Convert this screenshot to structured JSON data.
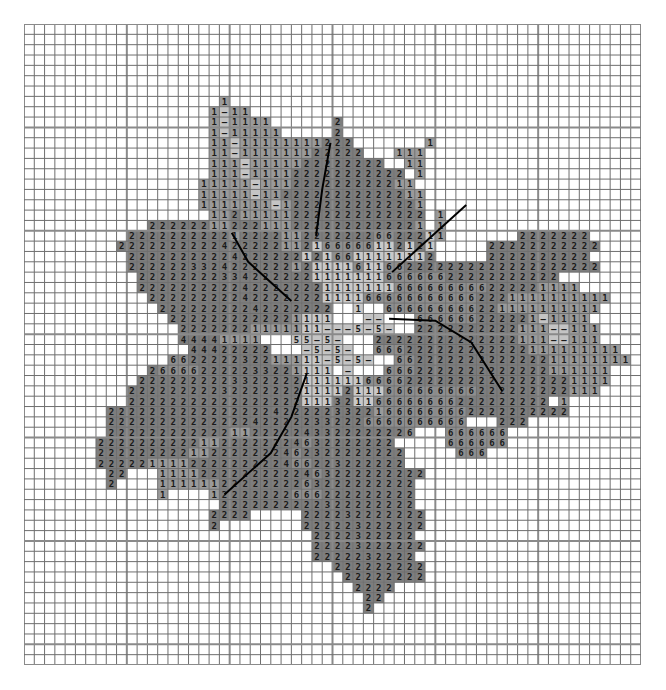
{
  "grid": {
    "cols": 60,
    "rows": 62,
    "major_every": 10
  },
  "colors": {
    "empty": "#ffffff",
    "line": "#6e6e6e",
    "major_line": "#8a8a8a",
    "2": "#7d7d7d",
    "1": "#9a9a9a",
    "1c": "#c9c9c9",
    "-": "#c4c4c4",
    "3": "#7d7d7d",
    "4": "#7d7d7d",
    "5": "#c4c4c4",
    "6": "#8e8e8e",
    "w": "#ffffff"
  },
  "legend_symbols": [
    "1",
    "2",
    "3",
    "4",
    "5",
    "6",
    "-"
  ],
  "rows": [
    "............................................................",
    "............................................................",
    "............................................................",
    "............................................................",
    "............................................................",
    "............................................................",
    "............................................................",
    "...................1........................................",
    "..................1-11......................................",
    "..................1-1111......2.............................",
    "..................1-11111.....2.............................",
    "..................11-11111111222.......1....................",
    "..................11-111111122222...111.....................",
    "..................111-1111122222222..11.....................",
    "..................111-111122222222222.1.....................",
    ".................11111-111222222222211......................",
    ".................11111-1122222222222211.....................",
    ".................1111111-12222222222221.....................",
    "..................112111112222222222222.1...................",
    "............222222112221112222222222221.1...................",
    "..........2222222222122221122222226622211.......2222222.....",
    ".........2222222222422222112166666112121.....22222222222....",
    "..........222222222242222221216611111112.....2222222222.....",
    "..........2222223324222222121111611662222222222222222222....",
    "...........22222222334222222111111166666622222222222........",
    "...........2222222222422222221111111666666666222221111......",
    "............222222222422222221111666666666662221111111111...",
    ".............22222222242222222..1..666666666221111111111....",
    "..............2222222222221111w..--..w666666222221-1111.....",
    "...............22222221111111---5-5-w.2222222222111--111....",
    "...............44441111ww.55-5-.w.22222222222222111--111....",
    "................44422222ww.-5-5-.w666222222222222111111111..",
    "..............662222232211111-5-5-.w66222222222222211111111.",
    "............266662222233221111.-..w6662222222222222111111...",
    "...........2222222223322222111111666622222222222222221111...",
    "..........2222222223222222211112111666666666222222222111....",
    "..........22222222222222222111321166666666222222222.1.......",
    "........222222222222222242222233221666666662222222222.......",
    "........22222222222222422222332226666666666...222...........",
    "........222222222222112222243322222226...666666.............",
    ".......22222222221122222224632222222.....666666.............",
    ".......222222222112222222462322222222.....666...............",
    ".......222221111222222222466223222222.......................",
    "........22...11112222222222463222222222.....................",
    "........2....1111112222222263222222222......................",
    ".............1....12222222666222222222......................",
    "...................2222222222322222222......................",
    "..................2222.....222232222222.....................",
    "..................2........222223222222.....................",
    "............................2222322222......................",
    "............................22223222222.....................",
    "............................2222232222......................",
    "..............................222222222.....................",
    "...............................22222222.....................",
    "................................2222........................",
    ".................................22.........................",
    ".................................2..........................",
    "............................................................",
    "............................................................",
    "............................................................",
    "............................................................",
    "............................................................"
  ],
  "lines": [
    {
      "name": "cable-line-top",
      "points": [
        [
          29.8,
          11.5
        ],
        [
          29.0,
          16.0
        ],
        [
          28.4,
          20.5
        ]
      ]
    },
    {
      "name": "cable-line-upper-left",
      "points": [
        [
          20.2,
          20.2
        ],
        [
          21.8,
          23.0
        ],
        [
          26.0,
          26.8
        ]
      ]
    },
    {
      "name": "cable-line-upper-right",
      "points": [
        [
          35.8,
          24.0
        ],
        [
          43.0,
          17.5
        ]
      ]
    },
    {
      "name": "cable-line-right",
      "points": [
        [
          35.5,
          28.5
        ],
        [
          40.0,
          28.7
        ],
        [
          43.5,
          30.8
        ],
        [
          46.5,
          35.5
        ]
      ]
    },
    {
      "name": "cable-line-lower-left",
      "points": [
        [
          27.5,
          33.8
        ],
        [
          26.0,
          38.0
        ],
        [
          24.0,
          41.5
        ],
        [
          19.5,
          45.5
        ]
      ]
    }
  ]
}
